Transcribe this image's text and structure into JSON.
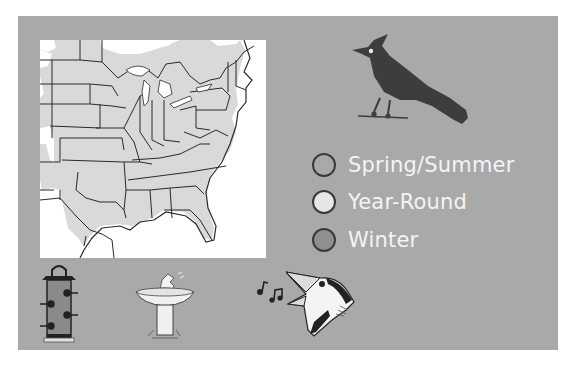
{
  "legend": {
    "items": [
      {
        "label": "Spring/Summer",
        "color": "#a9a9a9"
      },
      {
        "label": "Year-Round",
        "color": "#e6e6e6"
      },
      {
        "label": "Winter",
        "color": "#8f8f8f"
      }
    ]
  },
  "colors": {
    "panel": "#a9a9a9",
    "map_background": "#ffffff",
    "range_fill": "#d9d9d9",
    "bird_silhouette": "#3d3d3d",
    "legend_text": "#f4f4f4"
  },
  "icons": {
    "bird_silhouette": "crested-bird-icon",
    "feeder": "bird-feeder-icon",
    "birdbath": "birdbath-icon",
    "song": "music-notes-icon",
    "singing_bird": "singing-bird-icon"
  }
}
